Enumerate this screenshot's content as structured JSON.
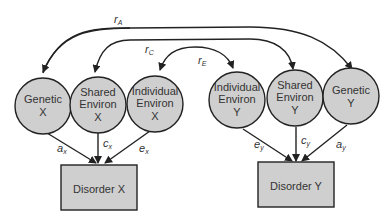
{
  "colors": {
    "node_fill": "#cfcfcf",
    "stroke": "#222222",
    "text": "#333333"
  },
  "latent_nodes": [
    {
      "id": "genetic-x",
      "line1": "Genetic",
      "line2": "X"
    },
    {
      "id": "shared-environ-x",
      "line1": "Shared",
      "line2": "Environ",
      "line3": "X"
    },
    {
      "id": "individual-environ-x",
      "line1": "Individual",
      "line2": "Environ",
      "line3": "X"
    },
    {
      "id": "individual-environ-y",
      "line1": "Individual",
      "line2": "Environ",
      "line3": "Y"
    },
    {
      "id": "shared-environ-y",
      "line1": "Shared",
      "line2": "Environ",
      "line3": "Y"
    },
    {
      "id": "genetic-y",
      "line1": "Genetic",
      "line2": "Y"
    }
  ],
  "observed_nodes": [
    {
      "id": "disorder-x",
      "label": "Disorder X"
    },
    {
      "id": "disorder-y",
      "label": "Disorder Y"
    }
  ],
  "correlations": [
    {
      "id": "rA",
      "main": "r",
      "sub": "A"
    },
    {
      "id": "rC",
      "main": "r",
      "sub": "C"
    },
    {
      "id": "rE",
      "main": "r",
      "sub": "E"
    }
  ],
  "paths": [
    {
      "id": "ax",
      "main": "a",
      "sub": "x"
    },
    {
      "id": "cx",
      "main": "c",
      "sub": "x"
    },
    {
      "id": "ex",
      "main": "e",
      "sub": "x"
    },
    {
      "id": "ey",
      "main": "e",
      "sub": "y"
    },
    {
      "id": "cy",
      "main": "c",
      "sub": "y"
    },
    {
      "id": "ay",
      "main": "a",
      "sub": "y"
    }
  ]
}
